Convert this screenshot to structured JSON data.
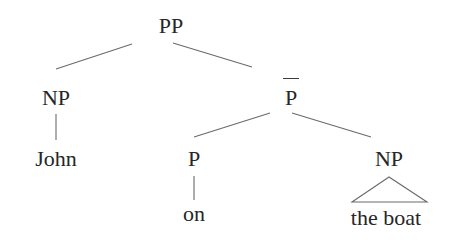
{
  "diagram": {
    "type": "syntax-tree",
    "nodes": [
      {
        "id": "pp",
        "label": "PP",
        "x": 171,
        "y": 15
      },
      {
        "id": "np_subject",
        "label": "NP",
        "x": 56,
        "y": 87
      },
      {
        "id": "pbar",
        "label": "P",
        "overbar": true,
        "x": 291,
        "y": 88
      },
      {
        "id": "john",
        "label": "John",
        "x": 56,
        "y": 148
      },
      {
        "id": "p",
        "label": "P",
        "x": 194,
        "y": 149
      },
      {
        "id": "np_object",
        "label": "NP",
        "x": 389,
        "y": 148
      },
      {
        "id": "on",
        "label": "on",
        "x": 194,
        "y": 204
      },
      {
        "id": "the_boat",
        "label": "the boat",
        "x": 386,
        "y": 207
      }
    ],
    "edges": [
      {
        "from": "pp",
        "to": "np_subject"
      },
      {
        "from": "pp",
        "to": "pbar"
      },
      {
        "from": "np_subject",
        "to": "john"
      },
      {
        "from": "pbar",
        "to": "p"
      },
      {
        "from": "pbar",
        "to": "np_object"
      },
      {
        "from": "p",
        "to": "on"
      },
      {
        "from": "np_object",
        "to": "the_boat",
        "style": "triangle"
      }
    ],
    "colors": {
      "line": "#6a6a6a",
      "text": "#262626",
      "background": "#ffffff"
    }
  }
}
